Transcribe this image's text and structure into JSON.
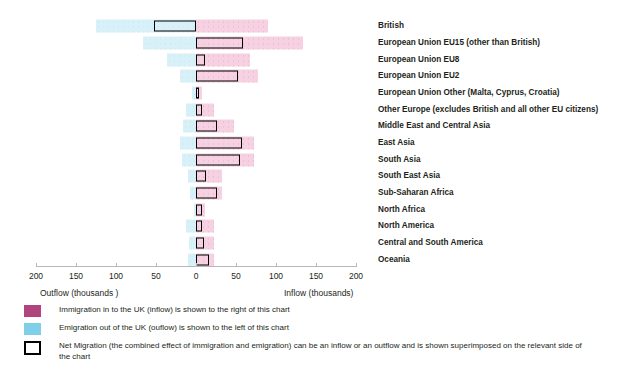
{
  "chart_data": {
    "type": "bar",
    "orientation": "horizontal",
    "title": "",
    "xlabel_left": "Outflow  (thousands )",
    "xlabel_right": "Inflow (thousands)",
    "ylabel": "",
    "xlim": [
      -200,
      200
    ],
    "grid": false,
    "tick_values": [
      -200,
      -150,
      -100,
      -50,
      0,
      50,
      100,
      150,
      200
    ],
    "tick_labels": [
      "200",
      "150",
      "100",
      "50",
      "0",
      "50",
      "100",
      "150",
      "200"
    ],
    "categories": [
      "British",
      "European Union EU15 (other than British)",
      "European Union EU8",
      "European Union EU2",
      "European Union Other (Malta, Cyprus, Croatia)",
      "Other Europe (excludes British and all other EU citizens)",
      "Middle East and Central Asia",
      "East Asia",
      "South Asia",
      "South East Asia",
      "Sub-Saharan Africa",
      "North Africa",
      "North America",
      "Central and South America",
      "Oceania"
    ],
    "series": [
      {
        "name": "Immigration in to the UK (inflow)",
        "color": "#b0447c",
        "side": "right",
        "values": [
          90,
          134,
          68,
          78,
          8,
          22,
          48,
          73,
          72,
          32,
          32,
          11,
          22,
          22,
          22
        ]
      },
      {
        "name": "Emigration out of the UK (outflow)",
        "color": "#7fcfe8",
        "side": "left",
        "values": [
          125,
          66,
          36,
          20,
          5,
          12,
          16,
          20,
          18,
          10,
          8,
          3,
          12,
          9,
          10
        ]
      },
      {
        "name": "Net Migration",
        "color": "#000000",
        "side": "signed",
        "values": [
          -52,
          59,
          11,
          53,
          4,
          8,
          26,
          57,
          55,
          13,
          26,
          8,
          8,
          10,
          16
        ]
      }
    ]
  },
  "axis": {
    "outflow_caption": "Outflow  (thousands )",
    "inflow_caption": "Inflow (thousands)"
  },
  "legend": {
    "items": [
      {
        "swatch": "inflow-swatch",
        "text": "Immigration in to the UK (inflow) is shown to the right of this chart"
      },
      {
        "swatch": "outflow-swatch",
        "text": "Emigration out of the UK (ouflow) is shown to the left of this chart"
      },
      {
        "swatch": "net-migration-swatch",
        "text": "Net Migration (the combined effect of immigration and emigration) can be an inflow or an outflow and is shown superimposed on the relevant side of the chart"
      }
    ]
  },
  "colors": {
    "inflow": "#b0447c",
    "outflow": "#7fcfe8",
    "net": "#000000",
    "inflow_fill": "#f6cfe0",
    "outflow_fill": "#d6f0f7",
    "axis": "#b8b8b8"
  }
}
